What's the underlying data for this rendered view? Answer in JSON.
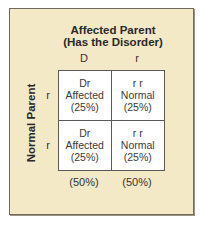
{
  "diagram": {
    "title_line1": "Affected Parent",
    "title_line2": "(Has the Disorder)",
    "row_axis_label": "Normal Parent",
    "columns": [
      "D",
      "r"
    ],
    "rows": [
      "r",
      "r"
    ],
    "cells": [
      [
        {
          "genotype": "Dr",
          "phenotype": "Affected",
          "percent": "(25%)"
        },
        {
          "genotype": "r r",
          "phenotype": "Normal",
          "percent": "(25%)"
        }
      ],
      [
        {
          "genotype": "Dr",
          "phenotype": "Affected",
          "percent": "(25%)"
        },
        {
          "genotype": "r r",
          "phenotype": "Normal",
          "percent": "(25%)"
        }
      ]
    ],
    "column_totals": [
      "(50%)",
      "(50%)"
    ],
    "colors": {
      "panel_background": "#f3e9c6",
      "panel_border": "#6f6a5c",
      "grid_background": "#ffffff",
      "grid_lines": "#5a5a5a",
      "text": "#2a2a2a"
    }
  }
}
